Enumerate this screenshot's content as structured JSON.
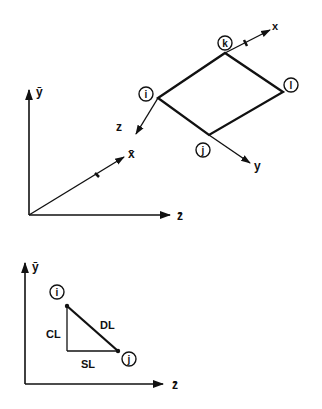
{
  "figure": {
    "top": {
      "global_axes": {
        "y_label": "ȳ",
        "x_label": "x̄",
        "z_label": "z̄"
      },
      "element": {
        "nodes": [
          {
            "id": "i",
            "label": "i"
          },
          {
            "id": "j",
            "label": "j"
          },
          {
            "id": "k",
            "label": "k"
          },
          {
            "id": "l",
            "label": "l"
          }
        ],
        "local_axes": {
          "x_label": "x",
          "y_label": "y",
          "z_label": "z"
        }
      }
    },
    "bottom": {
      "axes": {
        "y_label": "ȳ",
        "z_label": "z̄"
      },
      "nodes": [
        {
          "id": "i",
          "label": "i"
        },
        {
          "id": "j",
          "label": "j"
        }
      ],
      "segments": {
        "vertical_label": "CL",
        "diagonal_label": "DL",
        "horizontal_label": "SL"
      }
    }
  }
}
